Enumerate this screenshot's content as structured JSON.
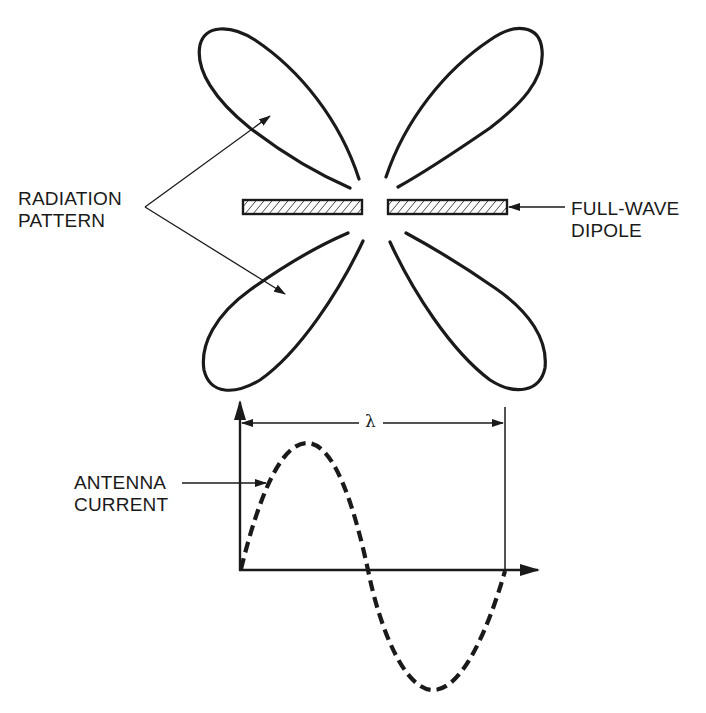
{
  "diagram": {
    "labels": {
      "radiation_pattern": {
        "line1": "RADIATION",
        "line2": "PATTERN"
      },
      "dipole": {
        "line1": "FULL-WAVE",
        "line2": "DIPOLE"
      },
      "antenna_current": {
        "line1": "ANTENNA",
        "line2": "CURRENT"
      },
      "wavelength_symbol": "λ"
    },
    "elements": {
      "lobes": [
        "upper-left",
        "upper-right",
        "lower-left",
        "lower-right"
      ],
      "dipole_segments": 2,
      "current_waveform": "one full sine cycle (dashed) spanning λ"
    },
    "colors": {
      "stroke": "#1a1a1a",
      "background": "#ffffff"
    }
  }
}
